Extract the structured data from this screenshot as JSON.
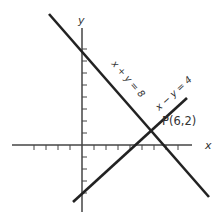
{
  "diagram": {
    "title": "",
    "axes": {
      "x_label": "x",
      "y_label": "y",
      "x_ticks": [
        -6,
        -5,
        -4,
        -3,
        -2,
        -1,
        1,
        2,
        3,
        4,
        5,
        6,
        7,
        8,
        9,
        10
      ],
      "y_ticks": [
        -6,
        -5,
        -4,
        -3,
        -2,
        -1,
        1,
        2,
        3,
        4,
        5,
        6,
        7,
        8
      ]
    },
    "lines": [
      {
        "equation": "x + y = 8",
        "label": "x + y = 8"
      },
      {
        "equation": "x − y = 4",
        "label": "x − y = 4"
      }
    ],
    "intersection": {
      "label": "P(6,2)",
      "x": 6,
      "y": 2
    },
    "colors": {
      "line": "#222222",
      "axis": "#333333",
      "text": "#333333"
    }
  }
}
